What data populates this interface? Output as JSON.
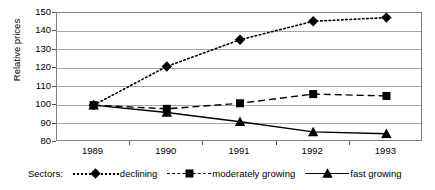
{
  "chart_data": {
    "type": "line",
    "title": "",
    "xlabel": "",
    "ylabel": "Relative prices",
    "categories": [
      "1989",
      "1990",
      "1991",
      "1992",
      "1993"
    ],
    "x": [
      1989,
      1990,
      1991,
      1992,
      1993
    ],
    "ylim": [
      80,
      150
    ],
    "yticks": [
      80,
      90,
      100,
      110,
      120,
      130,
      140,
      150
    ],
    "grid": "horizontal",
    "legend_position": "bottom",
    "legend_title": "Sectors:",
    "series": [
      {
        "name": "declining",
        "values": [
          100,
          121,
          135.5,
          145.5,
          147.5
        ],
        "marker": "diamond",
        "linestyle": "dotted",
        "color": "#000000"
      },
      {
        "name": "moderately growing",
        "values": [
          100,
          98,
          101,
          106,
          105
        ],
        "marker": "square",
        "linestyle": "dashed",
        "color": "#000000"
      },
      {
        "name": "fast growing",
        "values": [
          100,
          96,
          91,
          85.5,
          84.5
        ],
        "marker": "triangle",
        "linestyle": "solid",
        "color": "#000000"
      }
    ]
  }
}
